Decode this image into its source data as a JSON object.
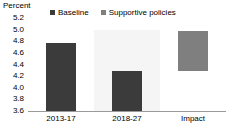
{
  "chart_data": {
    "type": "bar",
    "title": "",
    "ylabel": "Percent",
    "xlabel": "",
    "ylim": [
      3.6,
      5.2
    ],
    "ytick_labels": [
      "5.2",
      "5.0",
      "4.8",
      "4.6",
      "4.4",
      "4.2",
      "4.0",
      "3.8",
      "3.6"
    ],
    "ytick_values": [
      5.2,
      5.0,
      4.8,
      4.6,
      4.4,
      4.2,
      4.0,
      3.8,
      3.6
    ],
    "grid": false,
    "legend_position": "top",
    "categories": [
      "2013-17",
      "2018-27",
      "Impact"
    ],
    "series": [
      {
        "name": "Baseline",
        "color": "#3b3b3b",
        "values": [
          4.77,
          4.28,
          null
        ]
      },
      {
        "name": "Supportive policies",
        "color": "#7f7f7f",
        "values": [
          null,
          null,
          4.97
        ]
      }
    ],
    "bars": [
      {
        "category": "2013-17",
        "series": "Baseline",
        "base": 3.6,
        "top": 4.77,
        "color": "#3b3b3b",
        "floating": false
      },
      {
        "category": "2018-27",
        "series": "Baseline",
        "base": 3.6,
        "top": 4.28,
        "color": "#3b3b3b",
        "floating": false
      },
      {
        "category": "Impact",
        "series": "Supportive policies",
        "base": 4.28,
        "top": 4.97,
        "color": "#7f7f7f",
        "floating": true
      }
    ],
    "highlight_band": {
      "category": "2018-27",
      "top": 5.0,
      "base": 3.6,
      "color": "#f5f5f5"
    },
    "colors": {
      "baseline": "#3b3b3b",
      "supportive_policies": "#7f7f7f",
      "axis": "#9a9a9a",
      "text": "#000000",
      "band": "#f5f5f5",
      "background": "#ffffff"
    }
  },
  "legend": {
    "items": [
      {
        "label": "Baseline",
        "color": "#3b3b3b"
      },
      {
        "label": "Supportive policies",
        "color": "#7f7f7f"
      }
    ]
  },
  "axis": {
    "y_title": "Percent"
  }
}
